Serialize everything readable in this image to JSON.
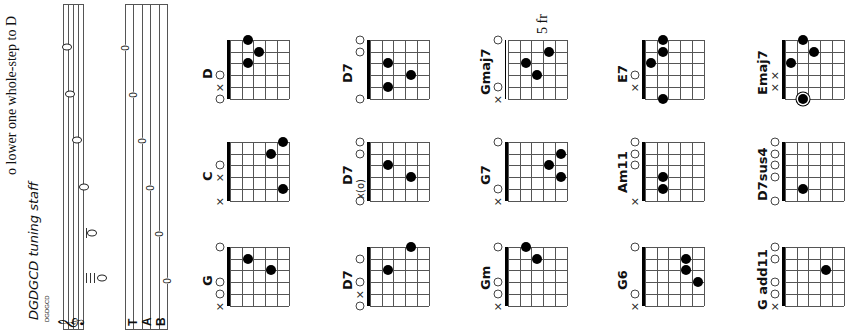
{
  "page": {
    "header_text": "o lower one whole-step to D",
    "tuning_title": "DGDGCD tuning staff",
    "tuning_small_label": "DGDGCD"
  },
  "staff": {
    "clef": "treble-clef",
    "tab_label": "TAB",
    "tab_letters": [
      "T",
      "A",
      "B"
    ],
    "tab_numbers": [
      "0",
      "0",
      "0",
      "0",
      "0",
      "0"
    ],
    "tuning_notes": [
      "D",
      "G",
      "D",
      "G",
      "C",
      "D"
    ]
  },
  "chords": [
    {
      "name": "D",
      "column": 0,
      "row": 0,
      "frets": [
        null,
        null,
        "o",
        2,
        3,
        2
      ],
      "marks": [
        "o",
        "x",
        "o",
        "",
        "",
        ""
      ],
      "dots": [
        [
          3,
          2
        ],
        [
          4,
          3
        ],
        [
          5,
          2
        ]
      ]
    },
    {
      "name": "C",
      "column": 0,
      "row": 1,
      "marks": [
        "x",
        "",
        "x",
        "o",
        "",
        ""
      ],
      "dots": [
        [
          1,
          5
        ],
        [
          4,
          4
        ],
        [
          5,
          5
        ]
      ]
    },
    {
      "name": "G",
      "column": 0,
      "row": 2,
      "marks": [
        "x",
        "o",
        "o",
        "",
        "",
        "o"
      ],
      "dots": [
        [
          3,
          4
        ],
        [
          4,
          2
        ]
      ]
    },
    {
      "name": "D7",
      "column": 1,
      "row": 0,
      "marks": [
        "o",
        "",
        "",
        "",
        "o",
        "o"
      ],
      "dots": [
        [
          1,
          2
        ],
        [
          2,
          4
        ],
        [
          3,
          2
        ]
      ]
    },
    {
      "name": "D7",
      "column": 1,
      "row": 1,
      "marks": [
        "o",
        "x(o)",
        "",
        "",
        "o",
        "o"
      ],
      "dots": [
        [
          2,
          4
        ],
        [
          3,
          2
        ]
      ]
    },
    {
      "name": "D7",
      "column": 1,
      "row": 2,
      "marks": [
        "o",
        "x",
        "o",
        "",
        "o",
        ""
      ],
      "dots": [
        [
          3,
          2
        ],
        [
          5,
          4
        ]
      ]
    },
    {
      "name": "Gmaj7",
      "column": 2,
      "row": 0,
      "fret_label": "5 fr",
      "marks": [
        "x",
        "o",
        "",
        "",
        "",
        "o"
      ],
      "dots": [
        [
          2,
          3
        ],
        [
          3,
          2
        ],
        [
          4,
          4
        ]
      ]
    },
    {
      "name": "G7",
      "column": 2,
      "row": 1,
      "marks": [
        "x",
        "o",
        "",
        "",
        "",
        "o"
      ],
      "dots": [
        [
          2,
          5
        ],
        [
          3,
          4
        ],
        [
          4,
          5
        ]
      ]
    },
    {
      "name": "Gm",
      "column": 2,
      "row": 2,
      "marks": [
        "x",
        "o",
        "o",
        "",
        "",
        "o"
      ],
      "dots": [
        [
          4,
          3
        ],
        [
          5,
          2
        ]
      ]
    },
    {
      "name": "E7",
      "column": 3,
      "row": 0,
      "marks": [
        "",
        "x",
        "o",
        "",
        "",
        ""
      ],
      "dots": [
        [
          0,
          2
        ],
        [
          3,
          1
        ],
        [
          4,
          2
        ],
        [
          5,
          2
        ]
      ]
    },
    {
      "name": "Am11",
      "column": 3,
      "row": 1,
      "marks": [
        "x",
        "",
        "",
        "o",
        "o",
        "o"
      ],
      "dots": [
        [
          1,
          2
        ],
        [
          2,
          2
        ]
      ]
    },
    {
      "name": "G6",
      "column": 3,
      "row": 2,
      "marks": [
        "x",
        "o",
        "",
        "",
        "",
        "o"
      ],
      "dots": [
        [
          2,
          5
        ],
        [
          3,
          4
        ],
        [
          4,
          4
        ]
      ]
    },
    {
      "name": "Emaj7",
      "column": 4,
      "row": 0,
      "marks": [
        "",
        "x",
        "x",
        "",
        "",
        ""
      ],
      "dots": [
        [
          0,
          2,
          "ring"
        ],
        [
          3,
          1
        ],
        [
          4,
          3
        ],
        [
          5,
          2
        ]
      ]
    },
    {
      "name": "D7sus4",
      "column": 4,
      "row": 1,
      "marks": [
        "o",
        "",
        "o",
        "o",
        "o",
        "o"
      ],
      "dots": [
        [
          1,
          2
        ]
      ]
    },
    {
      "name": "G add11",
      "column": 4,
      "row": 2,
      "marks": [
        "x",
        "o",
        "o",
        "",
        "o",
        "o"
      ],
      "dots": [
        [
          3,
          4
        ]
      ]
    }
  ]
}
